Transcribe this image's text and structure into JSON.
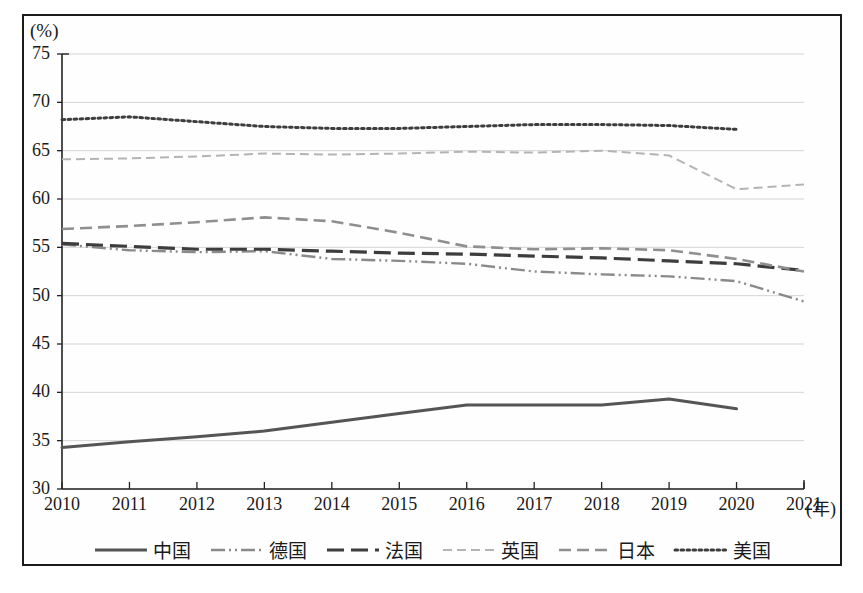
{
  "axes": {
    "y_unit_label": "(%)",
    "x_unit_label": "(年)",
    "y_ticks": [
      "75",
      "70",
      "65",
      "60",
      "55",
      "50",
      "45",
      "40",
      "35",
      "30"
    ],
    "x_ticks": [
      "2010",
      "2011",
      "2012",
      "2013",
      "2014",
      "2015",
      "2016",
      "2017",
      "2018",
      "2019",
      "2020",
      "2021"
    ]
  },
  "legend": {
    "items": [
      {
        "label": "中国",
        "style": "solid",
        "color": "#555555"
      },
      {
        "label": "德国",
        "style": "dashdotdot",
        "color": "#8a8a8a"
      },
      {
        "label": "法国",
        "style": "longdash",
        "color": "#3d3d3d"
      },
      {
        "label": "英国",
        "style": "finedash",
        "color": "#b4b4b4"
      },
      {
        "label": "日本",
        "style": "dash",
        "color": "#8f8f8f"
      },
      {
        "label": "美国",
        "style": "dotted",
        "color": "#3d3d3d"
      }
    ]
  },
  "chart_data": {
    "type": "line",
    "title": "",
    "xlabel": "(年)",
    "ylabel": "(%)",
    "ylim": [
      30,
      75
    ],
    "ytick_step": 5,
    "grid": true,
    "legend_position": "bottom",
    "x": [
      2010,
      2011,
      2012,
      2013,
      2014,
      2015,
      2016,
      2017,
      2018,
      2019,
      2020,
      2021
    ],
    "series": [
      {
        "name": "中国",
        "style": "solid",
        "color": "#555555",
        "values": [
          34.3,
          34.9,
          35.4,
          36.0,
          36.9,
          37.8,
          38.7,
          38.7,
          38.7,
          39.3,
          38.3,
          null
        ]
      },
      {
        "name": "德国",
        "style": "dashdotdot",
        "color": "#8a8a8a",
        "values": [
          55.3,
          54.7,
          54.5,
          54.6,
          53.8,
          53.6,
          53.3,
          52.5,
          52.2,
          52.0,
          51.5,
          49.4
        ]
      },
      {
        "name": "法国",
        "style": "longdash",
        "color": "#3d3d3d",
        "values": [
          55.4,
          55.1,
          54.8,
          54.8,
          54.6,
          54.4,
          54.3,
          54.1,
          53.9,
          53.6,
          53.3,
          52.6
        ]
      },
      {
        "name": "英国",
        "style": "finedash",
        "color": "#b4b4b4",
        "values": [
          64.1,
          64.2,
          64.4,
          64.7,
          64.6,
          64.7,
          64.9,
          64.8,
          65.0,
          64.5,
          61.0,
          61.5
        ]
      },
      {
        "name": "日本",
        "style": "dash",
        "color": "#8f8f8f",
        "values": [
          56.9,
          57.2,
          57.6,
          58.1,
          57.7,
          56.5,
          55.1,
          54.8,
          54.9,
          54.7,
          53.8,
          52.5
        ]
      },
      {
        "name": "美国",
        "style": "dotted",
        "color": "#3d3d3d",
        "values": [
          68.2,
          68.5,
          68.0,
          67.5,
          67.3,
          67.3,
          67.5,
          67.7,
          67.7,
          67.6,
          67.2,
          null
        ]
      }
    ]
  }
}
